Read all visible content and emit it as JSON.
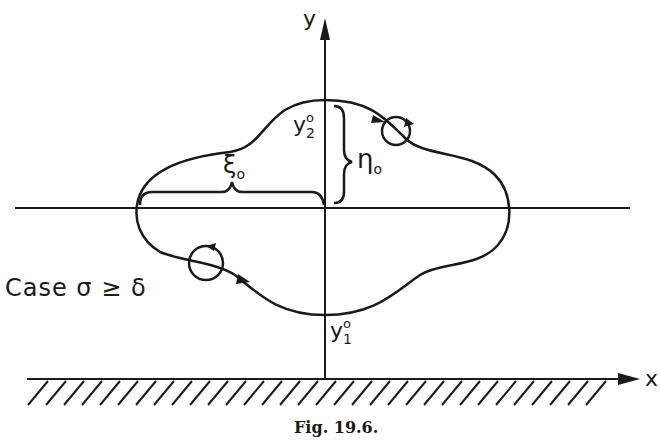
{
  "figure": {
    "caption": "Fig. 19.6.",
    "case_label": "Case σ ≥ δ",
    "axes": {
      "y_label": "y",
      "x_label": "x"
    },
    "annotations": {
      "y2_base": "y",
      "y2_sub": "2",
      "y2_sup": "o",
      "y1_base": "y",
      "y1_sub": "1",
      "y1_sup": "o",
      "eta_base": "η",
      "eta_sub": "o",
      "xi_base": "ξ",
      "xi_sub": "o"
    },
    "colors": {
      "ink": "#1a1a1a",
      "background": "#ffffff"
    }
  }
}
